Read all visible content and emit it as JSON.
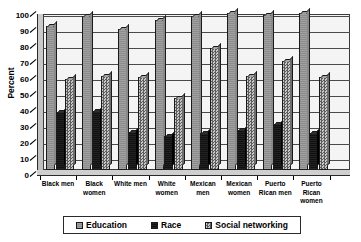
{
  "chart_data": {
    "type": "bar",
    "title": "",
    "subtitle": "",
    "xlabel": "",
    "ylabel": "Percent",
    "ylim": [
      0,
      100
    ],
    "ytick_values": [
      0,
      10,
      20,
      30,
      40,
      50,
      60,
      70,
      80,
      90,
      100
    ],
    "ytick_labels": [
      "0",
      "10",
      "20",
      "30",
      "40",
      "50",
      "60",
      "70",
      "80",
      "90",
      "100"
    ],
    "grid": true,
    "legend_position": "bottom",
    "categories": [
      "Black men",
      "Black women",
      "White men",
      "White women",
      "Mexican men",
      "Mexican women",
      "Puerto Rican men",
      "Puerto Rican women"
    ],
    "category_lines": [
      [
        "Black men"
      ],
      [
        "Black",
        "women"
      ],
      [
        "White men"
      ],
      [
        "White",
        "women"
      ],
      [
        "Mexican",
        "men"
      ],
      [
        "Mexican",
        "women"
      ],
      [
        "Puerto",
        "Rican men"
      ],
      [
        "Puerto",
        "Rican",
        "women"
      ]
    ],
    "series": [
      {
        "name": "Education",
        "color": "#8c8c8c",
        "values": [
          90,
          96,
          88,
          94,
          96,
          98,
          97,
          98
        ]
      },
      {
        "name": "Race",
        "color": "#111111",
        "values": [
          36,
          37,
          24,
          21,
          23,
          25,
          29,
          23
        ]
      },
      {
        "name": "Social networking",
        "color": "#7e7e7e",
        "values": [
          57,
          59,
          58,
          45,
          76,
          59,
          68,
          58
        ]
      }
    ]
  },
  "legend": {
    "items": [
      {
        "label": "Education",
        "swatch": "education-swatch"
      },
      {
        "label": "Race",
        "swatch": "race-swatch"
      },
      {
        "label": "Social networking",
        "swatch": "social-networking-swatch"
      }
    ]
  }
}
